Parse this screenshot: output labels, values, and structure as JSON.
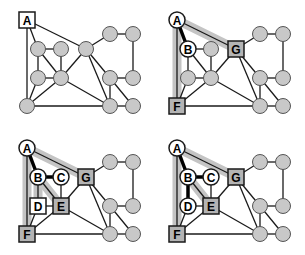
{
  "figure": {
    "panels": [
      {
        "id": "panel-1",
        "offset": [
          0,
          0
        ],
        "labels": {
          "A": "A"
        },
        "highlight_path": [],
        "tree_edges": []
      },
      {
        "id": "panel-2",
        "offset": [
          150,
          0
        ],
        "labels": {
          "A": "A",
          "B": "B",
          "G": "G",
          "F": "F"
        },
        "highlight_path": [
          [
            "A",
            "F"
          ],
          [
            "A",
            "G"
          ]
        ],
        "tree_edges": [
          [
            "A",
            "B"
          ]
        ]
      },
      {
        "id": "panel-3",
        "offset": [
          0,
          128
        ],
        "labels": {
          "A": "A",
          "B": "B",
          "C": "C",
          "G": "G",
          "D": "D",
          "E": "E",
          "F": "F"
        },
        "highlight_path": [
          [
            "A",
            "F"
          ],
          [
            "A",
            "G"
          ],
          [
            "B",
            "D"
          ],
          [
            "B",
            "E"
          ]
        ],
        "tree_edges": [
          [
            "A",
            "B"
          ],
          [
            "B",
            "C"
          ]
        ]
      },
      {
        "id": "panel-4",
        "offset": [
          150,
          128
        ],
        "labels": {
          "A": "A",
          "B": "B",
          "C": "C",
          "G": "G",
          "D": "D",
          "E": "E",
          "F": "F"
        },
        "highlight_path": [
          [
            "A",
            "F"
          ],
          [
            "A",
            "G"
          ],
          [
            "B",
            "E"
          ]
        ],
        "tree_edges": [
          [
            "A",
            "B"
          ],
          [
            "B",
            "C"
          ],
          [
            "B",
            "D"
          ]
        ]
      }
    ]
  },
  "colors": {
    "node_fill": "#c8c8c8",
    "visited_fill": "#ffffff",
    "frontier_fill": "#b4b4b4",
    "edge": "#1a1a1a",
    "highlight": "#c4c4c4",
    "tree_edge": "#000000"
  }
}
